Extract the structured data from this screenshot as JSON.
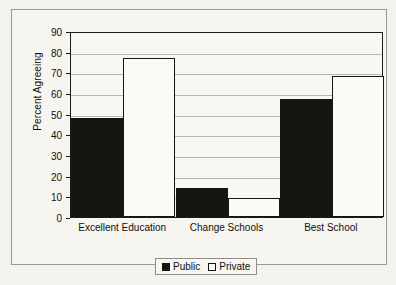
{
  "chart_data": {
    "type": "bar",
    "title": "",
    "xlabel": "",
    "ylabel": "Percent Agreeing",
    "ylim": [
      0,
      90
    ],
    "ytick_step": 10,
    "yticks": [
      0,
      10,
      20,
      30,
      40,
      50,
      60,
      70,
      80,
      90
    ],
    "grid": true,
    "legend_position": "bottom-center",
    "categories": [
      "Excellent Education",
      "Change Schools",
      "Best School"
    ],
    "series": [
      {
        "name": "Public",
        "color": "#161611",
        "values": [
          48,
          14,
          57
        ]
      },
      {
        "name": "Private",
        "color": "#fbfaf5",
        "values": [
          77,
          9,
          68
        ]
      }
    ]
  },
  "legend": {
    "items": [
      {
        "label": "Public",
        "swatch": "filled-square-icon"
      },
      {
        "label": "Private",
        "swatch": "hollow-square-icon"
      }
    ]
  }
}
